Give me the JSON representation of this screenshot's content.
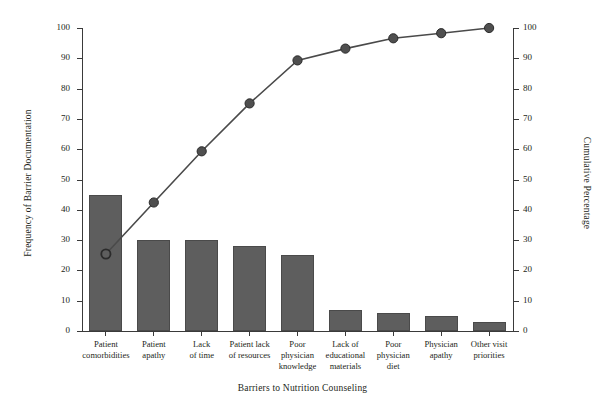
{
  "chart_data": {
    "type": "bar",
    "title": "",
    "xlabel": "Barriers to Nutrition Counseling",
    "ylabel": "Frequency of Barrier Documentation",
    "ylabel_secondary": "Cumulative Percentage",
    "categories": [
      "Patient\ncomorbidities",
      "Patient\napathy",
      "Lack\nof time",
      "Patient lack\nof resources",
      "Poor\nphysician\nknowledge",
      "Lack of\neducational\nmaterials",
      "Poor\nphysician\ndiet",
      "Physician\napathy",
      "Other visit\npriorities"
    ],
    "values": [
      45,
      30,
      30,
      28,
      25,
      7,
      6,
      5,
      3
    ],
    "series": [
      {
        "name": "Frequency of Barrier Documentation",
        "type": "bar",
        "axis": "left",
        "values": [
          45,
          30,
          30,
          28,
          25,
          7,
          6,
          5,
          3
        ],
        "color": "#5e5e5e"
      },
      {
        "name": "Cumulative Percentage",
        "type": "line",
        "axis": "right",
        "values": [
          25.4,
          42.4,
          59.3,
          75.1,
          89.3,
          93.2,
          96.6,
          98.3,
          100.0
        ],
        "color": "#4a4a4a",
        "marker": "circle"
      }
    ],
    "ylim": [
      0,
      100
    ],
    "ylim_secondary": [
      0,
      100
    ],
    "yticks": [
      0,
      10,
      20,
      30,
      40,
      50,
      60,
      70,
      80,
      90,
      100
    ],
    "yticks_secondary": [
      0,
      10,
      20,
      30,
      40,
      50,
      60,
      70,
      80,
      90,
      100
    ],
    "grid": false,
    "legend": "none"
  },
  "axes": {
    "left_title": "Frequency of Barrier Documentation",
    "right_title": "Cumulative Percentage",
    "x_title": "Barriers to Nutrition Counseling",
    "tick_labels": [
      "0",
      "10",
      "20",
      "30",
      "40",
      "50",
      "60",
      "70",
      "80",
      "90",
      "100"
    ]
  }
}
